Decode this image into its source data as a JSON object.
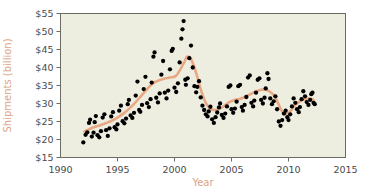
{
  "chart_data": {
    "type": "scatter",
    "title": "",
    "xlabel": "Year",
    "ylabel": "Shipments (billion)",
    "xlim": [
      1990,
      2015
    ],
    "ylim": [
      15,
      55
    ],
    "xticks": [
      1990,
      1995,
      2000,
      2005,
      2010,
      2015
    ],
    "xtick_labels": [
      "1990",
      "1995",
      "2000",
      "2005",
      "2010",
      "2015"
    ],
    "yticks": [
      15,
      20,
      25,
      30,
      35,
      40,
      45,
      50,
      55
    ],
    "ytick_labels": [
      "$15",
      "$20",
      "$25",
      "$30",
      "$35",
      "$40",
      "$45",
      "$50",
      "$55"
    ],
    "grid": false,
    "legend": null,
    "plot_bgcolor": "#eeeee0",
    "frame_color": "#6b6b63",
    "point_color": "#000000",
    "trend_color": "#e8a882",
    "axis_title_color": "#dba484",
    "tick_label_color": "#4a4a4a",
    "series": [
      {
        "name": "Shipments",
        "marker": "filled-circle",
        "points": [
          [
            1992.0,
            19.2
          ],
          [
            1992.2,
            21.3
          ],
          [
            1992.35,
            22.0
          ],
          [
            1992.5,
            24.6
          ],
          [
            1992.6,
            25.5
          ],
          [
            1992.75,
            20.8
          ],
          [
            1992.9,
            21.9
          ],
          [
            1993.0,
            24.8
          ],
          [
            1993.1,
            26.5
          ],
          [
            1993.25,
            21.2
          ],
          [
            1993.4,
            20.6
          ],
          [
            1993.55,
            22.3
          ],
          [
            1993.7,
            26.1
          ],
          [
            1993.85,
            27.0
          ],
          [
            1994.0,
            22.6
          ],
          [
            1994.15,
            21.0
          ],
          [
            1994.3,
            23.1
          ],
          [
            1994.45,
            26.4
          ],
          [
            1994.6,
            27.6
          ],
          [
            1994.75,
            23.4
          ],
          [
            1994.9,
            22.8
          ],
          [
            1995.0,
            24.2
          ],
          [
            1995.15,
            28.0
          ],
          [
            1995.3,
            29.4
          ],
          [
            1995.45,
            25.1
          ],
          [
            1995.6,
            24.5
          ],
          [
            1995.75,
            25.8
          ],
          [
            1995.9,
            29.8
          ],
          [
            1996.0,
            31.0
          ],
          [
            1996.15,
            26.7
          ],
          [
            1996.3,
            26.0
          ],
          [
            1996.45,
            27.4
          ],
          [
            1996.6,
            32.2
          ],
          [
            1996.75,
            36.1
          ],
          [
            1996.9,
            28.2
          ],
          [
            1997.0,
            27.7
          ],
          [
            1997.15,
            29.6
          ],
          [
            1997.3,
            34.0
          ],
          [
            1997.45,
            37.4
          ],
          [
            1997.6,
            30.1
          ],
          [
            1997.75,
            29.0
          ],
          [
            1997.9,
            31.2
          ],
          [
            1998.0,
            35.8
          ],
          [
            1998.15,
            43.0
          ],
          [
            1998.25,
            44.2
          ],
          [
            1998.4,
            31.6
          ],
          [
            1998.55,
            30.3
          ],
          [
            1998.7,
            32.8
          ],
          [
            1998.85,
            38.0
          ],
          [
            1999.0,
            41.8
          ],
          [
            1999.15,
            33.0
          ],
          [
            1999.3,
            31.4
          ],
          [
            1999.45,
            33.6
          ],
          [
            1999.6,
            39.5
          ],
          [
            1999.75,
            44.6
          ],
          [
            1999.85,
            45.2
          ],
          [
            2000.0,
            34.4
          ],
          [
            2000.15,
            33.2
          ],
          [
            2000.3,
            35.6
          ],
          [
            2000.45,
            41.4
          ],
          [
            2000.6,
            48.0
          ],
          [
            2000.7,
            50.6
          ],
          [
            2000.8,
            52.9
          ],
          [
            2000.95,
            36.6
          ],
          [
            2001.0,
            35.2
          ],
          [
            2001.15,
            37.0
          ],
          [
            2001.3,
            42.6
          ],
          [
            2001.45,
            46.1
          ],
          [
            2001.6,
            40.0
          ],
          [
            2001.75,
            34.8
          ],
          [
            2001.9,
            33.1
          ],
          [
            2002.0,
            34.6
          ],
          [
            2002.15,
            36.2
          ],
          [
            2002.3,
            31.7
          ],
          [
            2002.45,
            29.4
          ],
          [
            2002.6,
            28.2
          ],
          [
            2002.75,
            27.0
          ],
          [
            2002.9,
            26.4
          ],
          [
            2003.0,
            27.8
          ],
          [
            2003.15,
            29.1
          ],
          [
            2003.3,
            25.6
          ],
          [
            2003.45,
            24.6
          ],
          [
            2003.6,
            26.2
          ],
          [
            2003.75,
            27.5
          ],
          [
            2003.9,
            28.9
          ],
          [
            2004.0,
            30.0
          ],
          [
            2004.15,
            26.8
          ],
          [
            2004.3,
            26.0
          ],
          [
            2004.45,
            27.2
          ],
          [
            2004.6,
            29.2
          ],
          [
            2004.75,
            34.6
          ],
          [
            2004.9,
            35.0
          ],
          [
            2005.0,
            28.4
          ],
          [
            2005.15,
            27.4
          ],
          [
            2005.3,
            28.6
          ],
          [
            2005.45,
            30.5
          ],
          [
            2005.6,
            34.8
          ],
          [
            2005.75,
            35.2
          ],
          [
            2005.9,
            29.0
          ],
          [
            2006.0,
            28.0
          ],
          [
            2006.15,
            29.6
          ],
          [
            2006.3,
            31.8
          ],
          [
            2006.45,
            37.2
          ],
          [
            2006.6,
            37.8
          ],
          [
            2006.75,
            30.2
          ],
          [
            2006.9,
            29.2
          ],
          [
            2007.0,
            30.8
          ],
          [
            2007.15,
            33.0
          ],
          [
            2007.3,
            36.6
          ],
          [
            2007.45,
            37.0
          ],
          [
            2007.6,
            31.0
          ],
          [
            2007.75,
            30.0
          ],
          [
            2007.9,
            31.6
          ],
          [
            2008.0,
            34.2
          ],
          [
            2008.15,
            38.4
          ],
          [
            2008.25,
            36.8
          ],
          [
            2008.4,
            31.4
          ],
          [
            2008.55,
            29.8
          ],
          [
            2008.7,
            30.6
          ],
          [
            2008.85,
            32.0
          ],
          [
            2009.0,
            28.4
          ],
          [
            2009.15,
            25.0
          ],
          [
            2009.3,
            23.8
          ],
          [
            2009.45,
            25.4
          ],
          [
            2009.6,
            27.2
          ],
          [
            2009.75,
            28.0
          ],
          [
            2009.9,
            26.2
          ],
          [
            2010.0,
            25.4
          ],
          [
            2010.15,
            27.0
          ],
          [
            2010.3,
            29.2
          ],
          [
            2010.45,
            31.4
          ],
          [
            2010.6,
            30.2
          ],
          [
            2010.75,
            28.4
          ],
          [
            2010.9,
            27.6
          ],
          [
            2011.0,
            29.0
          ],
          [
            2011.15,
            31.2
          ],
          [
            2011.3,
            33.4
          ],
          [
            2011.45,
            32.0
          ],
          [
            2011.6,
            30.4
          ],
          [
            2011.75,
            29.6
          ],
          [
            2011.9,
            31.0
          ],
          [
            2012.0,
            32.6
          ],
          [
            2012.1,
            33.0
          ],
          [
            2012.2,
            30.2
          ],
          [
            2012.3,
            29.8
          ]
        ]
      }
    ],
    "trend": {
      "name": "Smoothed trend",
      "points": [
        [
          1992.1,
          22.2
        ],
        [
          1992.6,
          23.0
        ],
        [
          1993.1,
          23.6
        ],
        [
          1993.6,
          24.1
        ],
        [
          1994.1,
          24.7
        ],
        [
          1994.6,
          25.4
        ],
        [
          1995.1,
          26.3
        ],
        [
          1995.6,
          27.4
        ],
        [
          1996.1,
          28.8
        ],
        [
          1996.6,
          30.4
        ],
        [
          1997.1,
          32.2
        ],
        [
          1997.6,
          34.0
        ],
        [
          1998.1,
          35.6
        ],
        [
          1998.6,
          36.4
        ],
        [
          1999.1,
          36.9
        ],
        [
          1999.6,
          37.2
        ],
        [
          2000.1,
          37.6
        ],
        [
          2000.5,
          39.4
        ],
        [
          2000.9,
          41.8
        ],
        [
          2001.1,
          43.0
        ],
        [
          2001.4,
          42.6
        ],
        [
          2001.7,
          40.4
        ],
        [
          2002.0,
          37.4
        ],
        [
          2002.3,
          34.0
        ],
        [
          2002.6,
          31.2
        ],
        [
          2002.9,
          29.4
        ],
        [
          2003.2,
          28.4
        ],
        [
          2003.6,
          28.2
        ],
        [
          2004.0,
          28.6
        ],
        [
          2004.4,
          29.4
        ],
        [
          2004.8,
          30.4
        ],
        [
          2005.2,
          30.9
        ],
        [
          2005.6,
          31.2
        ],
        [
          2006.0,
          31.6
        ],
        [
          2006.4,
          32.2
        ],
        [
          2006.8,
          32.8
        ],
        [
          2007.2,
          33.4
        ],
        [
          2007.6,
          33.8
        ],
        [
          2008.0,
          33.8
        ],
        [
          2008.4,
          33.2
        ],
        [
          2008.8,
          32.0
        ],
        [
          2009.1,
          30.0
        ],
        [
          2009.4,
          28.0
        ],
        [
          2009.7,
          27.2
        ],
        [
          2010.0,
          27.4
        ],
        [
          2010.3,
          28.4
        ],
        [
          2010.6,
          29.6
        ],
        [
          2011.0,
          30.6
        ],
        [
          2011.4,
          31.2
        ],
        [
          2011.8,
          31.4
        ],
        [
          2012.2,
          31.0
        ]
      ]
    }
  }
}
